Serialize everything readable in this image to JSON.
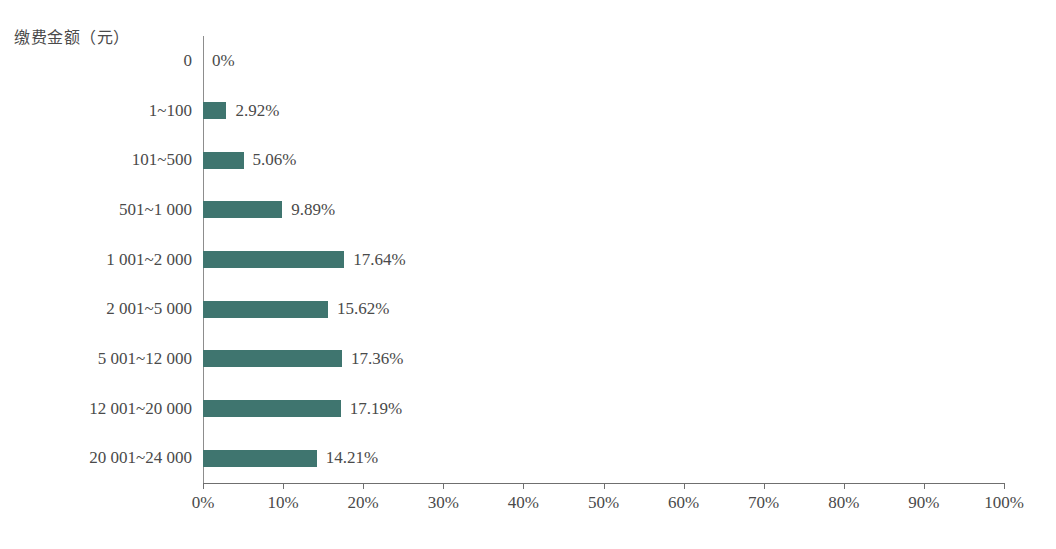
{
  "axis_title": "缴费金额（元）",
  "top_clipped_line": "",
  "chart_data": {
    "type": "bar",
    "orientation": "horizontal",
    "title": "",
    "xlabel": "",
    "ylabel": "缴费金额（元）",
    "categories": [
      "0",
      "1~100",
      "101~500",
      "501~1 000",
      "1 001~2 000",
      "2 001~5 000",
      "5 001~12 000",
      "12 001~20 000",
      "20 001~24 000"
    ],
    "values": [
      0,
      2.92,
      5.06,
      9.89,
      17.64,
      15.62,
      17.36,
      17.19,
      14.21
    ],
    "data_labels": [
      "0%",
      "2.92%",
      "5.06%",
      "9.89%",
      "17.64%",
      "15.62%",
      "17.36%",
      "17.19%",
      "14.21%"
    ],
    "xlim": [
      0,
      100
    ],
    "xticks": [
      0,
      10,
      20,
      30,
      40,
      50,
      60,
      70,
      80,
      90,
      100
    ],
    "xtick_labels": [
      "0%",
      "10%",
      "20%",
      "30%",
      "40%",
      "50%",
      "60%",
      "70%",
      "80%",
      "90%",
      "100%"
    ],
    "grid": false,
    "legend": false,
    "bar_color": "#3f756f",
    "axis_color": "#6f6f6f",
    "text_color": "#4a4a4a",
    "background": "#ffffff"
  }
}
